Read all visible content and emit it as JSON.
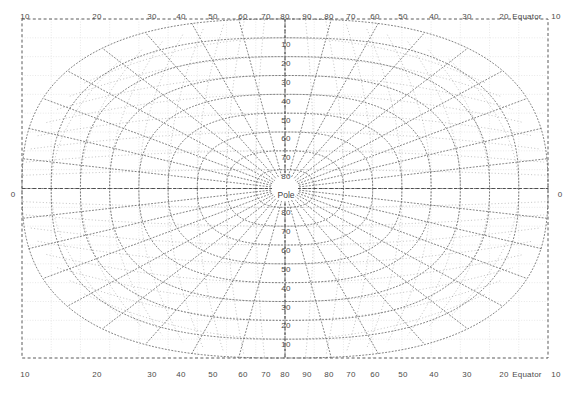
{
  "figure": {
    "title": "",
    "background_color": "#ffffff",
    "plot_area": {
      "left": 22,
      "top": 19,
      "right": 548,
      "bottom": 358
    },
    "grid_color": "#d9d9d9",
    "graticule_color": "#6b6b6b",
    "border_color": "#5a5a5a",
    "label_color": "#4a4a4a"
  },
  "chart_data": {
    "type": "line",
    "title": "",
    "subtitle": "",
    "xlabel": "",
    "ylabel": "",
    "projection": "polar-azimuthal-graticule",
    "grid": true,
    "legend": false,
    "xlim": [
      -100,
      100
    ],
    "ylim": [
      -100,
      100
    ],
    "center_label": "Pole",
    "equator_label": "Equator",
    "axis_zero_label": "0",
    "top_axis": {
      "position": "top",
      "tick_labels": [
        "10",
        "20",
        "30",
        "40",
        "50",
        "60",
        "70",
        "80",
        "90",
        "80",
        "70",
        "60",
        "50",
        "40",
        "30",
        "20",
        "Equator",
        "10"
      ],
      "tick_values": [
        10,
        20,
        30,
        40,
        50,
        60,
        70,
        80,
        90,
        80,
        70,
        60,
        50,
        40,
        30,
        20,
        10,
        0
      ]
    },
    "bottom_axis": {
      "position": "bottom",
      "tick_labels": [
        "10",
        "20",
        "30",
        "40",
        "50",
        "60",
        "70",
        "80",
        "90",
        "80",
        "70",
        "60",
        "50",
        "40",
        "30",
        "20",
        "Equator",
        "10"
      ],
      "tick_values": [
        10,
        20,
        30,
        40,
        50,
        60,
        70,
        80,
        90,
        80,
        70,
        60,
        50,
        40,
        30,
        20,
        10,
        0
      ]
    },
    "left_axis": {
      "position": "left",
      "tick_labels": [
        "0"
      ],
      "tick_values": [
        0
      ]
    },
    "right_axis": {
      "position": "right",
      "tick_labels": [
        "0"
      ],
      "tick_values": [
        0
      ]
    },
    "center_column_labels_upper": [
      "10",
      "20",
      "30",
      "40",
      "50",
      "60",
      "70",
      "80"
    ],
    "center_column_labels_lower": [
      "80",
      "70",
      "60",
      "50",
      "40",
      "30",
      "20",
      "10"
    ],
    "meridian_step_deg": 10,
    "parallel_step_deg": 10
  },
  "labels": {
    "top": [
      {
        "text": "10",
        "x": 25,
        "y": 12
      },
      {
        "text": "20",
        "x": 97,
        "y": 12
      },
      {
        "text": "30",
        "x": 152,
        "y": 12
      },
      {
        "text": "40",
        "x": 181,
        "y": 12
      },
      {
        "text": "50",
        "x": 213,
        "y": 12
      },
      {
        "text": "60",
        "x": 243,
        "y": 12
      },
      {
        "text": "70",
        "x": 266,
        "y": 12
      },
      {
        "text": "80",
        "x": 285,
        "y": 12
      },
      {
        "text": "90",
        "x": 307,
        "y": 12
      },
      {
        "text": "80",
        "x": 329,
        "y": 12
      },
      {
        "text": "70",
        "x": 351,
        "y": 12
      },
      {
        "text": "60",
        "x": 375,
        "y": 12
      },
      {
        "text": "50",
        "x": 403,
        "y": 12
      },
      {
        "text": "40",
        "x": 434,
        "y": 12
      },
      {
        "text": "30",
        "x": 467,
        "y": 12
      },
      {
        "text": "20",
        "x": 504,
        "y": 12
      },
      {
        "text": "Equator",
        "x": 527,
        "y": 12
      },
      {
        "text": "10",
        "x": 556,
        "y": 12
      }
    ],
    "bottom": [
      {
        "text": "10",
        "x": 25,
        "y": 370
      },
      {
        "text": "20",
        "x": 97,
        "y": 370
      },
      {
        "text": "30",
        "x": 152,
        "y": 370
      },
      {
        "text": "40",
        "x": 181,
        "y": 370
      },
      {
        "text": "50",
        "x": 213,
        "y": 370
      },
      {
        "text": "60",
        "x": 243,
        "y": 370
      },
      {
        "text": "70",
        "x": 266,
        "y": 370
      },
      {
        "text": "80",
        "x": 285,
        "y": 370
      },
      {
        "text": "90",
        "x": 307,
        "y": 370
      },
      {
        "text": "80",
        "x": 329,
        "y": 370
      },
      {
        "text": "70",
        "x": 351,
        "y": 370
      },
      {
        "text": "60",
        "x": 375,
        "y": 370
      },
      {
        "text": "50",
        "x": 403,
        "y": 370
      },
      {
        "text": "40",
        "x": 434,
        "y": 370
      },
      {
        "text": "30",
        "x": 467,
        "y": 370
      },
      {
        "text": "20",
        "x": 504,
        "y": 370
      },
      {
        "text": "Equator",
        "x": 527,
        "y": 370
      },
      {
        "text": "10",
        "x": 556,
        "y": 370
      }
    ],
    "left": [
      {
        "text": "0",
        "x": 13,
        "y": 194
      }
    ],
    "right": [
      {
        "text": "0",
        "x": 560,
        "y": 194
      }
    ],
    "center_upper": [
      {
        "text": "10",
        "x": 286,
        "y": 44
      },
      {
        "text": "20",
        "x": 286,
        "y": 63
      },
      {
        "text": "30",
        "x": 286,
        "y": 82
      },
      {
        "text": "40",
        "x": 286,
        "y": 101
      },
      {
        "text": "50",
        "x": 286,
        "y": 120
      },
      {
        "text": "60",
        "x": 286,
        "y": 138
      },
      {
        "text": "70",
        "x": 286,
        "y": 157
      },
      {
        "text": "80",
        "x": 286,
        "y": 176
      }
    ],
    "center_lower": [
      {
        "text": "80",
        "x": 286,
        "y": 212
      },
      {
        "text": "70",
        "x": 286,
        "y": 231
      },
      {
        "text": "60",
        "x": 286,
        "y": 250
      },
      {
        "text": "50",
        "x": 286,
        "y": 269
      },
      {
        "text": "40",
        "x": 286,
        "y": 288
      },
      {
        "text": "30",
        "x": 286,
        "y": 307
      },
      {
        "text": "20",
        "x": 286,
        "y": 325
      },
      {
        "text": "10",
        "x": 286,
        "y": 344
      }
    ],
    "pole": {
      "text": "Pole",
      "x": 286,
      "y": 195
    }
  }
}
